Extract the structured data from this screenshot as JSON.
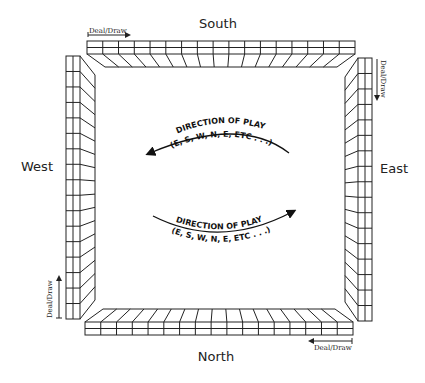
{
  "seats": {
    "south": "South",
    "west": "West",
    "east": "East",
    "north": "North"
  },
  "deal_draw": {
    "south": "Deal/Draw",
    "east": "Deal/Draw",
    "west": "Deal/Draw",
    "north": "Deal/Draw"
  },
  "direction_upper": {
    "line1": "DIRECTION OF PLAY",
    "line2": "(E, S, W, N, E, ETC . . .)"
  },
  "direction_lower": {
    "line1": "DIRECTION OF PLAY",
    "line2": "(E, S, W, N, E, ETC . . .)"
  },
  "walls": {
    "tiles_per_side": 17,
    "layers": 2
  },
  "colors": {
    "line": "#222222",
    "background": "#ffffff"
  }
}
